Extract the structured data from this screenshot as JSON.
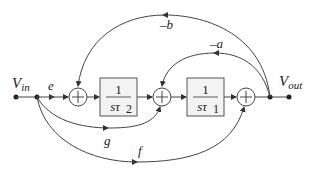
{
  "diagram": {
    "input_label": "V",
    "input_sub": "in",
    "output_label": "V",
    "output_sub": "out",
    "signal_e": "e",
    "gain_b": "–b",
    "gain_a": "–a",
    "gain_g": "g",
    "gain_f": "f",
    "block1": {
      "num": "1",
      "den_s": "sτ",
      "den_sub": "2"
    },
    "block2": {
      "num": "1",
      "den_s": "sτ",
      "den_sub": "1"
    },
    "sum_symbol": "+",
    "line_color": "#444444",
    "block_fill": "#f3f3f3"
  }
}
